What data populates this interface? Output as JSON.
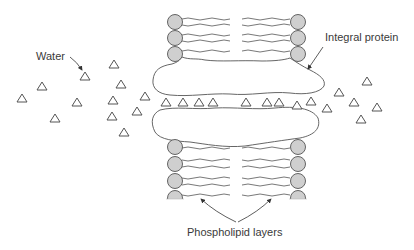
{
  "diagram": {
    "labels": {
      "water": "Water",
      "integral_protein": "Integral protein",
      "phospholipid_layers": "Phospholipid layers"
    },
    "colors": {
      "line": "#4a4a4a",
      "phospholipid_head_fill": "#cfcfcf",
      "background": "#ffffff"
    },
    "water_molecules_outside_left": 12,
    "water_molecules_in_channel": 8,
    "water_molecules_outside_right": 9,
    "phospholipid_heads_per_column_upper": 3,
    "phospholipid_heads_per_column_lower": 4
  }
}
